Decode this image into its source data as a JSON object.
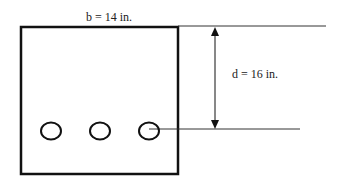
{
  "diagram": {
    "type": "beam cross-section",
    "width_label": "b = 14 in.",
    "depth_label": "d = 16 in.",
    "rebar_count": 3,
    "colors": {
      "stroke": "#111111",
      "thin_line": "#333333",
      "background": "#ffffff"
    }
  }
}
